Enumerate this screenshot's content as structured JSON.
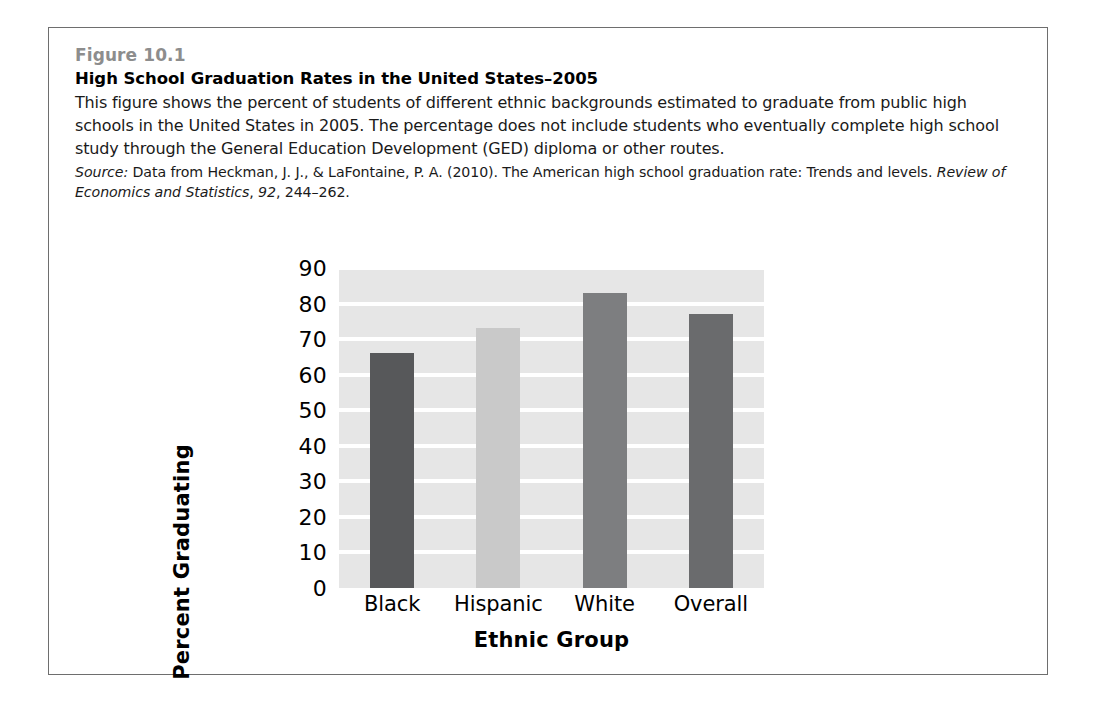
{
  "figure": {
    "number": "Figure 10.1",
    "title": "High School Graduation Rates in the United States–2005",
    "description": "This figure shows the percent of students of different ethnic backgrounds estimated to graduate from public high schools in the United States in 2005. The percentage does not include students who eventually complete high school study through the General Education Development (GED) diploma or other routes.",
    "source": {
      "lead": "Source:",
      "part1": " Data from Heckman, J. J., & LaFontaine, P. A. (2010). The American high school graduation rate: Trends and levels. ",
      "journal": "Review of Economics and Statistics",
      "sep1": ", ",
      "volume": "92",
      "pages": ", 244–262."
    }
  },
  "chart_data": {
    "type": "bar",
    "title": "High School Graduation Rates in the United States–2005",
    "categories": [
      "Black",
      "Hispanic",
      "White",
      "Overall"
    ],
    "values": [
      66,
      73,
      83,
      77
    ],
    "bar_colors": [
      "#57585a",
      "#c9c9c9",
      "#7d7e80",
      "#6a6b6d"
    ],
    "xlabel": "Ethnic Group",
    "ylabel": "Percent Graduating",
    "ylim": [
      0,
      90
    ],
    "yticks": [
      0,
      10,
      20,
      30,
      40,
      50,
      60,
      70,
      80,
      90
    ],
    "ytick_labels": [
      "0",
      "10",
      "20",
      "30",
      "40",
      "50",
      "60",
      "70",
      "80",
      "90"
    ],
    "grid": true,
    "grid_color": "#ffffff",
    "plot_background": "#e6e6e6",
    "legend": null
  }
}
